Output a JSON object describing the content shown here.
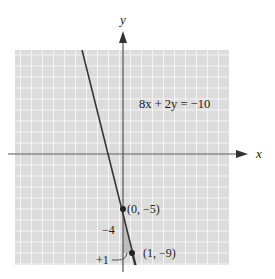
{
  "chart_data": {
    "type": "line",
    "title": "",
    "equation": "8x + 2y = −10",
    "xlabel": "x",
    "ylabel": "y",
    "grid": true,
    "xlim": [
      -10,
      10
    ],
    "ylim": [
      -10,
      10
    ],
    "series": [
      {
        "name": "8x + 2y = -10",
        "slope": -4,
        "intercept": -5,
        "points": [
          {
            "x": 0,
            "y": -5,
            "label": "(0, −5)"
          },
          {
            "x": 1,
            "y": -9,
            "label": "(1, −9)"
          }
        ]
      }
    ],
    "annotations": [
      {
        "text": "−4",
        "meaning": "rise"
      },
      {
        "text": "+1",
        "meaning": "run"
      }
    ]
  },
  "labels": {
    "equation": "8x + 2y = −10",
    "x_axis": "x",
    "y_axis": "y",
    "point1": "(0, −5)",
    "point2": "(1, −9)",
    "rise": "−4",
    "run": "+1"
  },
  "colors": {
    "grid_bg": "#dcdcdc",
    "grid_line": "#f4f4f4",
    "axis": "#555555",
    "line": "#333333",
    "triangle": "#b9b9b9"
  }
}
